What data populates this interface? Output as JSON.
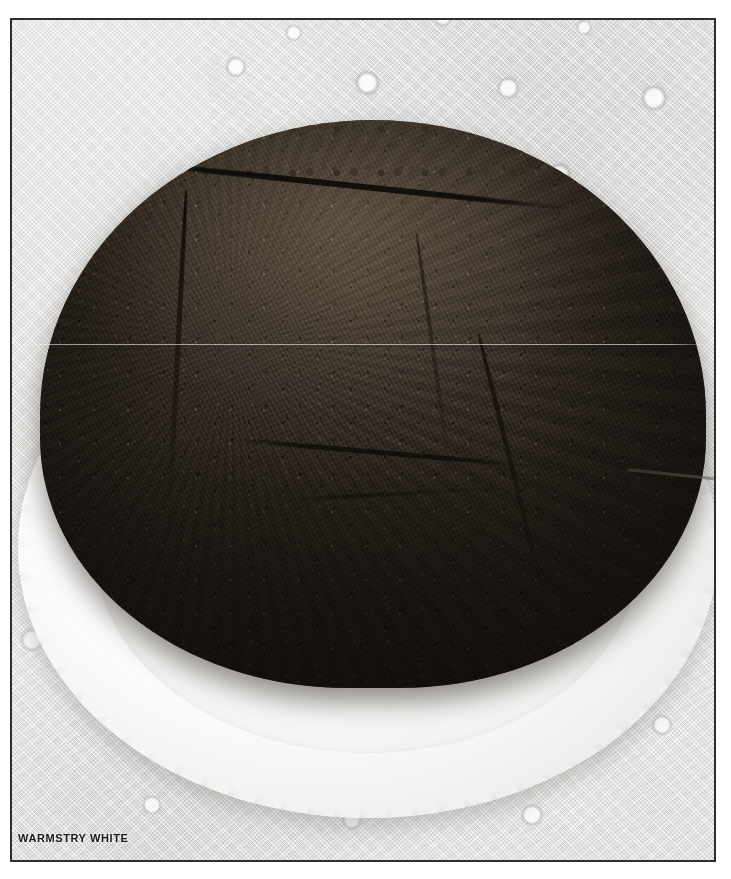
{
  "photo": {
    "caption": "WARMSTRY WHITE",
    "subject": "chocolate-cake-on-plate",
    "border_color": "#2e2e2e",
    "page_background": "#ffffff"
  },
  "scene": {
    "cake": {
      "name": "round chocolate cake",
      "surface": "cracked crumbly top",
      "color_top": "#4c4237",
      "color_side": "#221d17"
    },
    "plate": {
      "name": "white fluted dinner plate",
      "color": "#ffffff",
      "rim": "scalloped"
    },
    "tablecloth": {
      "name": "white lace tablecloth",
      "color": "#eeeeec"
    },
    "shadow": {
      "name": "soft cast shadow upper left",
      "color": "#8a8a88"
    }
  }
}
